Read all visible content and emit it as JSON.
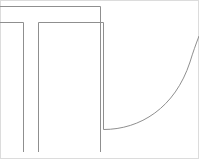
{
  "document": {
    "title": "Technical Line Drawing",
    "kind": "vector-line-art",
    "width": 199,
    "height": 159,
    "background_color": "#ffffff"
  },
  "colors": {
    "stroke": "#8f8f8f",
    "stroke_dark": "#7a7a7a",
    "frame": "#d8d8d8",
    "background": "#ffffff"
  },
  "geometry": {
    "stroke_width": 1,
    "frame": {
      "label": "image-frame",
      "x": 0.5,
      "y": 0.5,
      "width": 198,
      "height": 158,
      "color": "#dcdcdc"
    },
    "paths": [
      {
        "name": "upper-horizontal-rail",
        "description": "Top horizontal line running from left edge to upper right corner, then turning down",
        "d": "M 0 6.5 L 100.5 6.5 L 100.5 152"
      },
      {
        "name": "left-flange-horizontal",
        "description": "Second horizontal line, left segment, from left edge turning down at x=23",
        "d": "M 0 22.5 L 23.5 22.5 L 23.5 152"
      },
      {
        "name": "inner-horizontal-rail",
        "description": "Second horizontal line, right segment, from x=38 to x=103 then turning down",
        "d": "M 38.5 22.5 L 103.5 22.5 L 103.5 129.5"
      },
      {
        "name": "inner-left-vertical",
        "description": "Vertical line descending from x=38 to the bottom",
        "d": "M 38.5 22.5 L 38.5 152"
      },
      {
        "name": "fillet-arc",
        "description": "Quarter circle arc sweeping from the inner bottom corner up to the right edge",
        "d": "M 103.5 129.5 C 140 129.5 175 108 190 62 C 193 52 196 44 199 36"
      }
    ]
  },
  "labels": {
    "none": ""
  }
}
